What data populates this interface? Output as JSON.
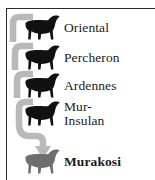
{
  "figure": {
    "kind": "horse-breed-ancestry-diagram",
    "colors": {
      "silhouette_black": "#111111",
      "silhouette_gray": "#6e6e6e",
      "connector_gray": "#b9b9b9",
      "frame_rule": "#2b2b2b",
      "text": "#1a1a1a",
      "background": "#ffffff"
    }
  },
  "ancestors": [
    {
      "id": "oriental",
      "label": "Oriental",
      "lines": [
        "Oriental"
      ],
      "icon": "horse-silhouette-icon",
      "icon_color": "#111111",
      "bold": false
    },
    {
      "id": "percheron",
      "label": "Percheron",
      "lines": [
        "Percheron"
      ],
      "icon": "horse-silhouette-icon",
      "icon_color": "#111111",
      "bold": false
    },
    {
      "id": "ardennes",
      "label": "Ardennes",
      "lines": [
        "Ardennes"
      ],
      "icon": "horse-silhouette-icon",
      "icon_color": "#111111",
      "bold": false
    },
    {
      "id": "mur-insulan",
      "label": "Mur-Insulan",
      "lines": [
        "Mur-",
        "Insulan"
      ],
      "icon": "horse-silhouette-icon",
      "icon_color": "#111111",
      "bold": false
    }
  ],
  "result": {
    "id": "murakosi",
    "label": "Murakosi",
    "lines": [
      "Murakosi"
    ],
    "icon": "horse-silhouette-icon",
    "icon_color": "#6e6e6e",
    "bold": true
  },
  "connector": {
    "name": "ancestry-arrow",
    "style": "rounded brackets joining downward into a single arrowhead",
    "color": "#b9b9b9",
    "arrow_direction": "down"
  }
}
